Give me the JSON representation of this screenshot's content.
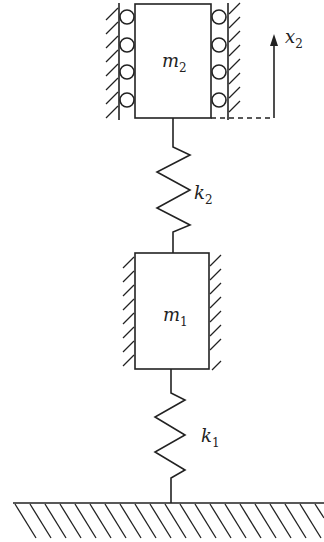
{
  "diagram": {
    "type": "two-degree-of-freedom spring-mass system",
    "masses": [
      {
        "id": "m2",
        "symbol": "m",
        "subscript": "2",
        "support": "rollers between guide walls"
      },
      {
        "id": "m1",
        "symbol": "m",
        "subscript": "1",
        "support": "frictionless guide walls"
      }
    ],
    "springs": [
      {
        "id": "k2",
        "symbol": "k",
        "subscript": "2",
        "connects": [
          "m2",
          "m1"
        ]
      },
      {
        "id": "k1",
        "symbol": "k",
        "subscript": "1",
        "connects": [
          "m1",
          "ground"
        ]
      }
    ],
    "displacement": {
      "symbol": "x",
      "subscript": "2",
      "direction": "up"
    },
    "ground": "fixed hatched base"
  },
  "labels": {
    "m2": {
      "main": "m",
      "sub": "2"
    },
    "m1": {
      "main": "m",
      "sub": "1"
    },
    "k2": {
      "main": "k",
      "sub": "2"
    },
    "k1": {
      "main": "k",
      "sub": "1"
    },
    "x2": {
      "main": "x",
      "sub": "2"
    }
  }
}
